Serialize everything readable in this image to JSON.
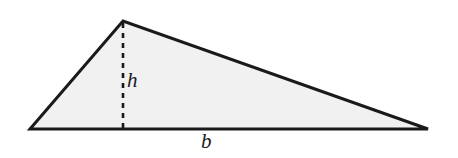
{
  "figure": {
    "name": "triangle-area-diagram",
    "background_color": "#ffffff",
    "fill_color": "#f1f1f1",
    "stroke_color": "#1a1a1a",
    "stroke_width": 3,
    "dash_color": "#1a1a1a",
    "dash_pattern": "5,5",
    "dash_width": 2.6
  },
  "geometry": {
    "apex": {
      "x": 123,
      "y": 21
    },
    "left_vertex": {
      "x": 30,
      "y": 129
    },
    "right_vertex": {
      "x": 428,
      "y": 129
    },
    "altitude_foot": {
      "x": 123,
      "y": 129
    },
    "polygon_points": "30,129 123,21 428,129"
  },
  "labels": {
    "height": "h",
    "base": "b"
  }
}
